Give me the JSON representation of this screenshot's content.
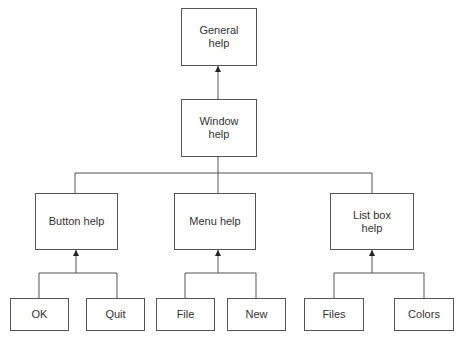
{
  "diagram": {
    "type": "hierarchy",
    "nodes": [
      {
        "id": "general",
        "label": "General\nhelp",
        "line1": "General",
        "line2": "help"
      },
      {
        "id": "window",
        "label": "Window\nhelp",
        "line1": "Window",
        "line2": "help"
      },
      {
        "id": "button",
        "label": "Button help"
      },
      {
        "id": "menu",
        "label": "Menu help"
      },
      {
        "id": "listbox",
        "label": "List box\nhelp",
        "line1": "List box",
        "line2": "help"
      },
      {
        "id": "ok",
        "label": "OK"
      },
      {
        "id": "quit",
        "label": "Quit"
      },
      {
        "id": "file",
        "label": "File"
      },
      {
        "id": "new",
        "label": "New"
      },
      {
        "id": "files",
        "label": "Files"
      },
      {
        "id": "colors",
        "label": "Colors"
      }
    ],
    "edges": [
      {
        "from": "window",
        "to": "general"
      },
      {
        "from": "button",
        "to": "window"
      },
      {
        "from": "menu",
        "to": "window"
      },
      {
        "from": "listbox",
        "to": "window"
      },
      {
        "from": "ok",
        "to": "button"
      },
      {
        "from": "quit",
        "to": "button"
      },
      {
        "from": "file",
        "to": "menu"
      },
      {
        "from": "new",
        "to": "menu"
      },
      {
        "from": "files",
        "to": "listbox"
      },
      {
        "from": "colors",
        "to": "listbox"
      }
    ]
  }
}
